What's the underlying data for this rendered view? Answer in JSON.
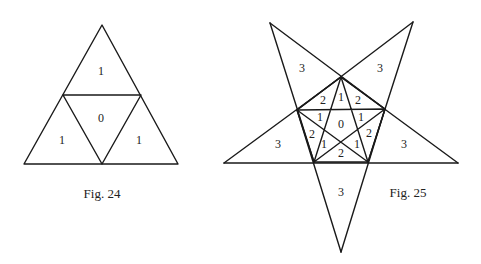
{
  "figures": [
    {
      "caption": "Fig. 24",
      "shape": "triangle subdivided into 4 triangles",
      "region_labels": {
        "top": "1",
        "center": "0",
        "bottom_left": "1",
        "bottom_right": "1"
      }
    },
    {
      "caption": "Fig. 25",
      "shape": "five-pointed star with inscribed pentagon and pentagram",
      "region_labels": {
        "outer_top_left": "3",
        "outer_top_right": "3",
        "outer_left": "3",
        "outer_right": "3",
        "outer_bottom": "3",
        "inner_top_left": "2",
        "inner_top": "1",
        "inner_top_right": "2",
        "inner_left_upper": "1",
        "center": "0",
        "inner_right_upper": "1",
        "inner_left": "2",
        "inner_right": "2",
        "inner_left_lower": "1",
        "inner_right_lower": "1",
        "inner_bottom": "2"
      }
    }
  ],
  "colors": {
    "line": "#1a1a1a",
    "background": "#ffffff"
  }
}
